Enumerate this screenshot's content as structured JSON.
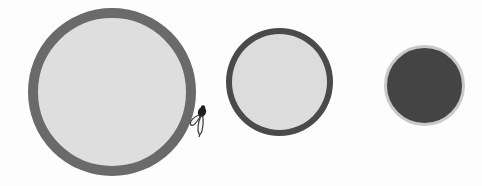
{
  "scene": {
    "background": "#fdfdfd",
    "circles": [
      {
        "id": "large",
        "fill": "#dedede",
        "border": "#6a6a6a",
        "border_width": 10,
        "diameter": 168
      },
      {
        "id": "medium",
        "fill": "#dcdcdc",
        "border": "#4a4a4a",
        "border_width": 6,
        "diameter": 107
      },
      {
        "id": "small",
        "fill": "#444444",
        "border": "#c9c9c9",
        "border_width": 3,
        "diameter": 81
      }
    ],
    "icons": [
      {
        "name": "fly-icon",
        "position": "right edge of large circle"
      }
    ]
  }
}
